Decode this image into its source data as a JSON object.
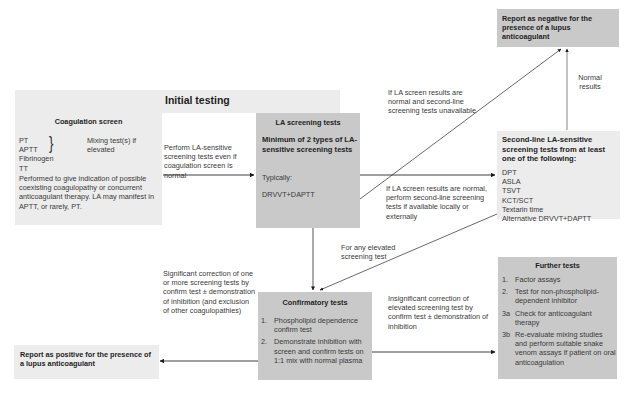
{
  "initial_testing": {
    "title": "Initial testing"
  },
  "coagulation_screen": {
    "title": "Coagulation screen",
    "tests": [
      "PT",
      "APTT",
      "Fibrinogen",
      "TT"
    ],
    "brace_note": "Mixing test(s) if elevated",
    "note": "Performed to give indication of possible coexisting coagulopathy or concurrent anticoagulant therapy. LA may manifest in APTT, or rarely, PT."
  },
  "arrow_labels": {
    "perform_la": "Perform LA-sensitive screening tests even if coagulation screen is normal",
    "la_normal_unavailable": "If LA screen results are normal and second-line screening tests unavailable",
    "la_normal_perform_second": "If LA screen results are normal, perform second-line screening  tests if available locally or externally",
    "normal_results": "Normal results",
    "any_elevated": "For any elevated screening test",
    "significant_correction": "Significant correction of one or more screening tests by confirm test ± demonstration of inhibition (and exclusion of other coagulopathies)",
    "insignificant_correction": "Insignificant correction of elevated screening test by confirm test ± demonstration of inhibition"
  },
  "la_screening": {
    "title": "LA screening tests",
    "subtitle": "Minimum of 2 types of LA-sensitive screening tests",
    "typically_label": "Typically:",
    "typical_tests": "DRVVT+DAPTT"
  },
  "report_negative": {
    "text": "Report as negative for the presence of a lupus anticoagulant"
  },
  "report_positive": {
    "text": "Report as positive for the presence of a lupus anticoagulant"
  },
  "second_line": {
    "title": "Second-line LA-sensitive screening tests from at least one of the following:",
    "tests": [
      "DPT",
      "ASLA",
      "TSVT",
      "KCT/SCT",
      "Textarin time",
      "Alternative DRVVT+DAPTT"
    ]
  },
  "confirmatory": {
    "title": "Confirmatory tests",
    "steps": [
      {
        "num": "1.",
        "text": "Phospholipid dependence confirm test"
      },
      {
        "num": "2.",
        "text": "Demonstrate inhibition with screen and confirm tests on 1:1 mix with normal plasma"
      }
    ]
  },
  "further_tests": {
    "title": "Further tests",
    "steps": [
      {
        "num": "1.",
        "text": "Factor assays"
      },
      {
        "num": "2.",
        "text": "Test for non-phospholipid-dependent inhibitor"
      },
      {
        "num": "3a",
        "text": "Check for anticoagulant therapy"
      },
      {
        "num": "3b",
        "text": "Re-evaluate mixing studies and perform suitable snake venom assays if patient on oral anticoagulation"
      }
    ]
  },
  "colors": {
    "light_box": "#ececec",
    "mid_box": "#d9d9d9",
    "dark_box": "#c9c9c9",
    "line": "#2a2a2a"
  }
}
